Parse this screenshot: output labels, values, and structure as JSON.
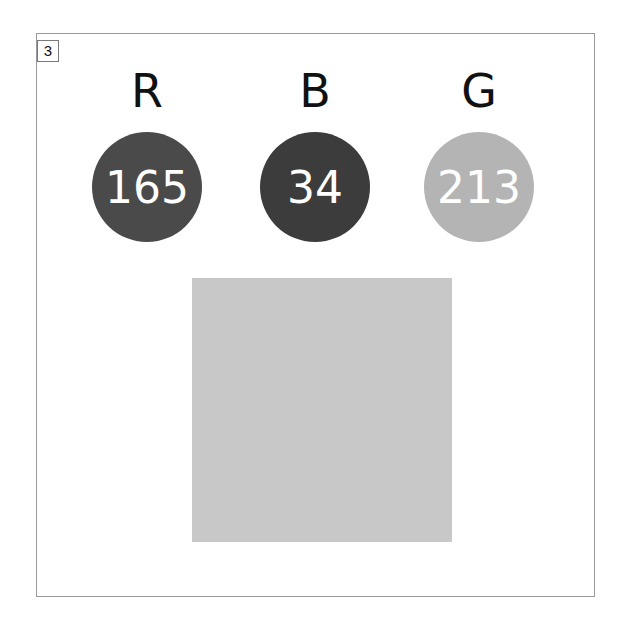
{
  "panel": {
    "index_label": "3",
    "border_color": "#9a9a9a"
  },
  "channels": [
    {
      "letter": "R",
      "value": "165",
      "circle_color": "#4a4a4a"
    },
    {
      "letter": "B",
      "value": "34",
      "circle_color": "#3c3c3c"
    },
    {
      "letter": "G",
      "value": "213",
      "circle_color": "#b4b4b4"
    }
  ],
  "swatch": {
    "color": "#c8c8c8"
  }
}
